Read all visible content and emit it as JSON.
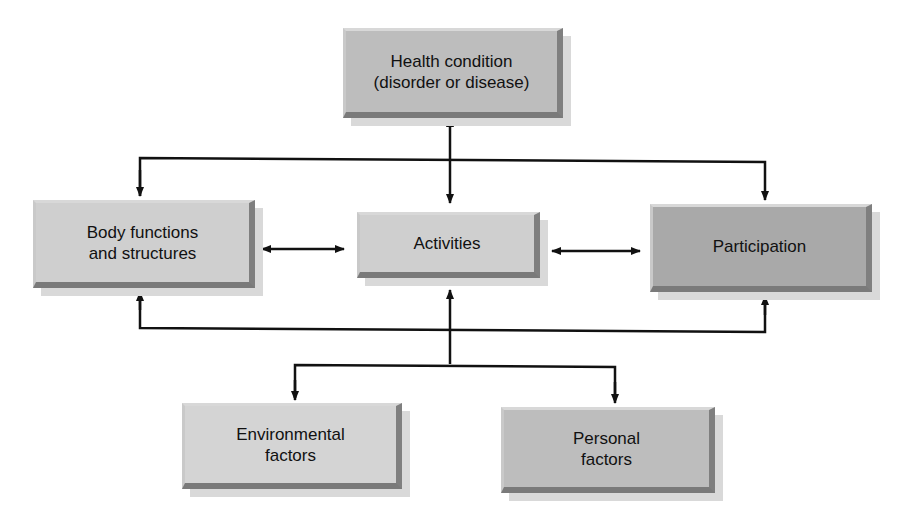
{
  "diagram": {
    "nodes": {
      "health_condition": {
        "label": "Health condition\n(disorder or disease)"
      },
      "body_functions": {
        "label": "Body functions\nand structures"
      },
      "activities": {
        "label": "Activities"
      },
      "participation": {
        "label": "Participation"
      },
      "environmental": {
        "label": "Environmental\nfactors"
      },
      "personal": {
        "label": "Personal\nfactors"
      }
    },
    "edges": [
      {
        "from": "health_condition",
        "to": "activities",
        "type": "bidirectional"
      },
      {
        "from": "health_condition",
        "to": "body_functions",
        "type": "directed"
      },
      {
        "from": "health_condition",
        "to": "participation",
        "type": "directed"
      },
      {
        "from": "body_functions",
        "to": "activities",
        "type": "bidirectional"
      },
      {
        "from": "activities",
        "to": "participation",
        "type": "bidirectional"
      },
      {
        "from": "contextual_bus",
        "to": "body_functions",
        "type": "directed"
      },
      {
        "from": "contextual_bus",
        "to": "activities",
        "type": "directed"
      },
      {
        "from": "contextual_bus",
        "to": "participation",
        "type": "directed"
      },
      {
        "from": "contextual_bus",
        "to": "environmental",
        "type": "directed"
      },
      {
        "from": "contextual_bus",
        "to": "personal",
        "type": "directed"
      }
    ],
    "colors": {
      "line": "#111111",
      "box_light": "#cfcfcf",
      "box_mid": "#bdbdbd",
      "box_dark": "#a9a9a9"
    }
  }
}
